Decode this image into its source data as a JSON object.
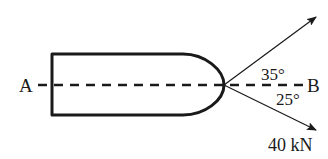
{
  "diagram": {
    "type": "force-diagram",
    "body": "rounded-end bar",
    "axis": {
      "start_label": "A",
      "end_label": "B",
      "style": "dashed"
    },
    "forces": [
      {
        "direction": "upper-right",
        "angle_label": "35°",
        "magnitude_label": ""
      },
      {
        "direction": "lower-right",
        "angle_label": "25°",
        "magnitude_label": "40 kN"
      }
    ],
    "colors": {
      "ink": "#1a1a1a",
      "background": "#ffffff"
    }
  }
}
